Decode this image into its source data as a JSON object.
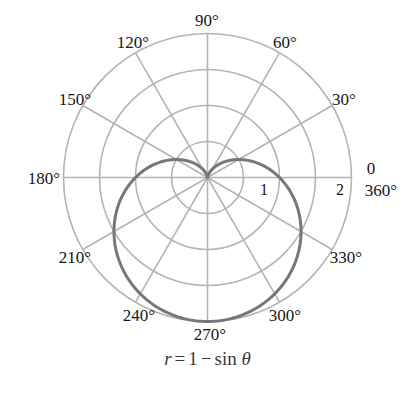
{
  "figure": {
    "title": "",
    "equation": {
      "lhs": "r",
      "equals": "=",
      "const": "1",
      "minus": "−",
      "fn": "sin",
      "theta": "θ",
      "full": "r = 1 − sin θ"
    },
    "colors": {
      "curve": "#777777",
      "grid": "#b4b4b4",
      "grid_light": "#c2c2c2",
      "text": "#161616",
      "equation_text": "#3b3b3b",
      "background": "#ffffff"
    }
  },
  "chart_data": {
    "type": "line",
    "subtype": "polar",
    "title": "",
    "equation_label": "r = 1 − sin θ",
    "curve_name": "cardioid",
    "formula": "r = 1 - sin(theta)",
    "xlabel": "",
    "ylabel": "",
    "rlim": [
      0,
      2
    ],
    "theta_direction": "counterclockwise",
    "theta_zero_location": "E",
    "grid": true,
    "legend": "none",
    "angular_tick_step_deg": 30,
    "angular_ticks_deg": [
      0,
      30,
      60,
      90,
      120,
      150,
      180,
      210,
      240,
      270,
      300,
      330
    ],
    "angular_tick_labels": [
      "0",
      "30°",
      "60°",
      "90°",
      "120°",
      "150°",
      "180°",
      "210°",
      "240°",
      "270°",
      "300°",
      "330°"
    ],
    "extra_angular_label": "360°",
    "radial_ticks": [
      0.5,
      1,
      1.5,
      2
    ],
    "radial_tick_labels_shown": [
      "1",
      "2"
    ],
    "theta_deg": [
      0,
      10,
      20,
      30,
      40,
      50,
      60,
      70,
      80,
      90,
      100,
      110,
      120,
      130,
      140,
      150,
      160,
      170,
      180,
      190,
      200,
      210,
      220,
      230,
      240,
      250,
      260,
      270,
      280,
      290,
      300,
      310,
      320,
      330,
      340,
      350,
      360
    ],
    "r_values": [
      1.0,
      0.826,
      0.658,
      0.5,
      0.357,
      0.234,
      0.134,
      0.06,
      0.015,
      0.0,
      0.015,
      0.06,
      0.134,
      0.234,
      0.357,
      0.5,
      0.658,
      0.826,
      1.0,
      1.174,
      1.342,
      1.5,
      1.643,
      1.766,
      1.866,
      1.94,
      1.985,
      2.0,
      1.985,
      1.94,
      1.866,
      1.766,
      1.643,
      1.5,
      1.342,
      1.174,
      1.0
    ],
    "key_points": [
      {
        "theta_deg": 0,
        "r": 1
      },
      {
        "theta_deg": 90,
        "r": 0
      },
      {
        "theta_deg": 180,
        "r": 1
      },
      {
        "theta_deg": 270,
        "r": 2
      }
    ]
  },
  "angle_labels": [
    {
      "text": "90°",
      "x": 207,
      "y": 20,
      "anchor": "middle"
    },
    {
      "text": "120°",
      "x": 133,
      "y": 42,
      "anchor": "middle"
    },
    {
      "text": "60°",
      "x": 285,
      "y": 42,
      "anchor": "middle"
    },
    {
      "text": "150°",
      "x": 75,
      "y": 99,
      "anchor": "middle"
    },
    {
      "text": "30°",
      "x": 344,
      "y": 99,
      "anchor": "middle"
    },
    {
      "text": "180°",
      "x": 44,
      "y": 178,
      "anchor": "middle"
    },
    {
      "text": "0",
      "x": 371,
      "y": 168,
      "anchor": "middle"
    },
    {
      "text": "360°",
      "x": 381,
      "y": 190,
      "anchor": "middle"
    },
    {
      "text": "210°",
      "x": 75,
      "y": 257,
      "anchor": "middle"
    },
    {
      "text": "330°",
      "x": 346,
      "y": 257,
      "anchor": "middle"
    },
    {
      "text": "240°",
      "x": 139,
      "y": 315,
      "anchor": "middle"
    },
    {
      "text": "300°",
      "x": 285,
      "y": 315,
      "anchor": "middle"
    },
    {
      "text": "270°",
      "x": 210,
      "y": 334,
      "anchor": "middle"
    }
  ],
  "radial_labels": [
    {
      "text": "1",
      "x": 264,
      "y": 190
    },
    {
      "text": "2",
      "x": 340,
      "y": 190
    }
  ]
}
